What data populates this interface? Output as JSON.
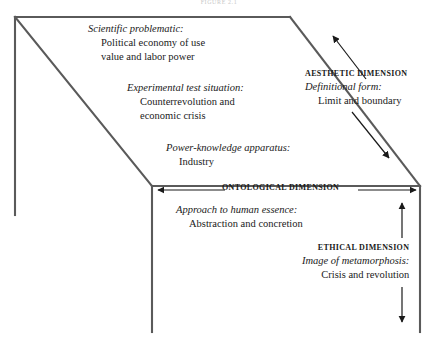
{
  "figure": {
    "caption": "FIGURE 2.1"
  },
  "blocks": {
    "scientific": {
      "heading": "Scientific problematic:",
      "line1": "Political economy of use",
      "line2": "value and labor power"
    },
    "experimental": {
      "heading": "Experimental test situation:",
      "line1": "Counterrevolution and",
      "line2": "economic crisis"
    },
    "power": {
      "heading": "Power-knowledge apparatus:",
      "line1": "Industry"
    },
    "ontological": {
      "dimension": "ONTOLOGICAL DIMENSION",
      "heading": "Approach to human essence:",
      "line1": "Abstraction and concretion"
    },
    "aesthetic": {
      "dimension": "AESTHETIC DIMENSION",
      "heading": "Definitional form:",
      "line1": "Limit and boundary"
    },
    "ethical": {
      "dimension": "ETHICAL DIMENSION",
      "heading": "Image of metamorphosis:",
      "line1": "Crisis and revolution"
    }
  },
  "style": {
    "line_color": "#4a4a4a",
    "text_color": "#1a1a1a",
    "background": "#ffffff"
  }
}
